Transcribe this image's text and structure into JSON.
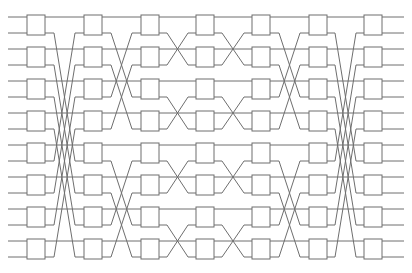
{
  "figure": {
    "title": "",
    "kind": "switching-network-diagram",
    "width": 412,
    "height": 273,
    "background_color": "#ffffff",
    "line_color": "#6e6e6e",
    "box_fill_color": "#ffffff",
    "line_width": 1
  },
  "network": {
    "wire_count": 16,
    "stage_count": 7,
    "switches_per_stage": 8,
    "wire_top_y": 17,
    "wire_spacing": 16,
    "box_width": 18,
    "box_height": 20,
    "box_left_x": [
      27,
      84,
      141,
      196,
      252,
      309,
      364
    ],
    "left_margin_x": 8,
    "right_margin_x": 404,
    "stage_labels": [
      "1",
      "2",
      "3",
      "4",
      "5",
      "6",
      "7"
    ],
    "permutations": [
      {
        "name": "stage1-to-stage2",
        "comment": "wide butterfly: distance-8 shuffle on lower outputs",
        "maps": [
          [
            0,
            0
          ],
          [
            1,
            9
          ],
          [
            2,
            2
          ],
          [
            3,
            11
          ],
          [
            4,
            4
          ],
          [
            5,
            13
          ],
          [
            6,
            6
          ],
          [
            7,
            15
          ],
          [
            8,
            8
          ],
          [
            9,
            1
          ],
          [
            10,
            10
          ],
          [
            11,
            3
          ],
          [
            12,
            12
          ],
          [
            13,
            5
          ],
          [
            14,
            14
          ],
          [
            15,
            7
          ]
        ]
      },
      {
        "name": "stage2-to-stage3",
        "comment": "distance-4 butterfly within each half",
        "maps": [
          [
            0,
            0
          ],
          [
            1,
            5
          ],
          [
            2,
            2
          ],
          [
            3,
            7
          ],
          [
            4,
            4
          ],
          [
            5,
            1
          ],
          [
            6,
            6
          ],
          [
            7,
            3
          ],
          [
            8,
            8
          ],
          [
            9,
            13
          ],
          [
            10,
            10
          ],
          [
            11,
            15
          ],
          [
            12,
            12
          ],
          [
            13,
            9
          ],
          [
            14,
            14
          ],
          [
            15,
            11
          ]
        ]
      },
      {
        "name": "stage3-to-stage4",
        "comment": "distance-2 butterfly",
        "maps": [
          [
            0,
            0
          ],
          [
            1,
            3
          ],
          [
            2,
            2
          ],
          [
            3,
            1
          ],
          [
            4,
            4
          ],
          [
            5,
            7
          ],
          [
            6,
            6
          ],
          [
            7,
            5
          ],
          [
            8,
            8
          ],
          [
            9,
            11
          ],
          [
            10,
            10
          ],
          [
            11,
            9
          ],
          [
            12,
            12
          ],
          [
            13,
            15
          ],
          [
            14,
            14
          ],
          [
            15,
            13
          ]
        ]
      },
      {
        "name": "stage4-to-stage5",
        "comment": "distance-2 butterfly (mirror)",
        "maps": [
          [
            0,
            0
          ],
          [
            1,
            3
          ],
          [
            2,
            2
          ],
          [
            3,
            1
          ],
          [
            4,
            4
          ],
          [
            5,
            7
          ],
          [
            6,
            6
          ],
          [
            7,
            5
          ],
          [
            8,
            8
          ],
          [
            9,
            11
          ],
          [
            10,
            10
          ],
          [
            11,
            9
          ],
          [
            12,
            12
          ],
          [
            13,
            15
          ],
          [
            14,
            14
          ],
          [
            15,
            13
          ]
        ]
      },
      {
        "name": "stage5-to-stage6",
        "comment": "distance-4 butterfly within each half (mirror)",
        "maps": [
          [
            0,
            0
          ],
          [
            1,
            5
          ],
          [
            2,
            2
          ],
          [
            3,
            7
          ],
          [
            4,
            4
          ],
          [
            5,
            1
          ],
          [
            6,
            6
          ],
          [
            7,
            3
          ],
          [
            8,
            8
          ],
          [
            9,
            13
          ],
          [
            10,
            10
          ],
          [
            11,
            15
          ],
          [
            12,
            12
          ],
          [
            13,
            9
          ],
          [
            14,
            14
          ],
          [
            15,
            11
          ]
        ]
      },
      {
        "name": "stage6-to-stage7",
        "comment": "wide butterfly: distance-8 shuffle (mirror)",
        "maps": [
          [
            0,
            0
          ],
          [
            1,
            9
          ],
          [
            2,
            2
          ],
          [
            3,
            11
          ],
          [
            4,
            4
          ],
          [
            5,
            13
          ],
          [
            6,
            6
          ],
          [
            7,
            15
          ],
          [
            8,
            8
          ],
          [
            9,
            1
          ],
          [
            10,
            10
          ],
          [
            11,
            3
          ],
          [
            12,
            12
          ],
          [
            13,
            5
          ],
          [
            14,
            14
          ],
          [
            15,
            7
          ]
        ]
      }
    ]
  }
}
